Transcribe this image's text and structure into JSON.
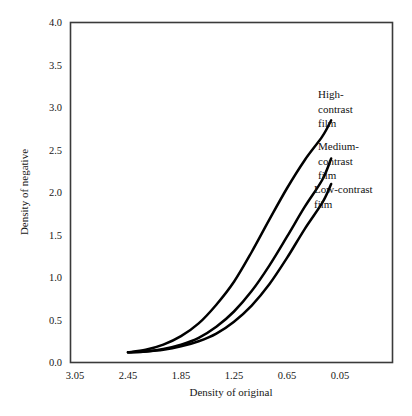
{
  "chart_data": {
    "type": "line",
    "title": "",
    "xlabel": "Density of original",
    "ylabel": "Density of negative",
    "x_tick_labels": [
      "3.05",
      "2.45",
      "1.85",
      "1.25",
      "0.65",
      "0.05"
    ],
    "y_tick_labels": [
      "0.0",
      "0.5",
      "1.0",
      "1.5",
      "2.0",
      "2.5",
      "3.0",
      "3.5",
      "4.0"
    ],
    "xlim": [
      3.05,
      0.05
    ],
    "ylim": [
      0.0,
      4.0
    ],
    "x_axis_reversed": true,
    "grid": false,
    "legend_position": "inline-right-annotations",
    "series": [
      {
        "name": "High-contrast film",
        "label_lines": [
          "High-",
          "contrast",
          "film"
        ],
        "x": [
          2.45,
          2.25,
          2.05,
          1.85,
          1.65,
          1.45,
          1.25,
          1.05,
          0.85,
          0.65,
          0.45,
          0.25,
          0.15
        ],
        "y": [
          0.12,
          0.15,
          0.21,
          0.31,
          0.46,
          0.68,
          0.95,
          1.3,
          1.68,
          2.05,
          2.38,
          2.66,
          2.85
        ]
      },
      {
        "name": "Medium-contrast film",
        "label_lines": [
          "Medium-",
          "contrast",
          "film"
        ],
        "x": [
          2.45,
          2.25,
          2.05,
          1.85,
          1.65,
          1.45,
          1.25,
          1.05,
          0.85,
          0.65,
          0.45,
          0.25,
          0.15
        ],
        "y": [
          0.12,
          0.13,
          0.16,
          0.21,
          0.29,
          0.42,
          0.6,
          0.84,
          1.14,
          1.48,
          1.83,
          2.15,
          2.4
        ]
      },
      {
        "name": "Low-contrast film",
        "label_lines": [
          "Low-contrast",
          "film"
        ],
        "x": [
          2.45,
          2.25,
          2.05,
          1.85,
          1.65,
          1.45,
          1.25,
          1.05,
          0.85,
          0.65,
          0.45,
          0.25,
          0.15
        ],
        "y": [
          0.12,
          0.13,
          0.15,
          0.19,
          0.25,
          0.34,
          0.48,
          0.67,
          0.92,
          1.23,
          1.57,
          1.88,
          2.1
        ]
      }
    ]
  }
}
